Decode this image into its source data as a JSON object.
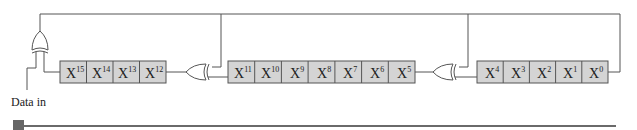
{
  "diagram": {
    "input_label": "Data in",
    "register_groups": [
      {
        "cells": [
          {
            "base": "X",
            "exp": "15"
          },
          {
            "base": "X",
            "exp": "14"
          },
          {
            "base": "X",
            "exp": "13"
          },
          {
            "base": "X",
            "exp": "12"
          }
        ]
      },
      {
        "cells": [
          {
            "base": "X",
            "exp": "11"
          },
          {
            "base": "X",
            "exp": "10"
          },
          {
            "base": "X",
            "exp": "9"
          },
          {
            "base": "X",
            "exp": "8"
          },
          {
            "base": "X",
            "exp": "7"
          },
          {
            "base": "X",
            "exp": "6"
          },
          {
            "base": "X",
            "exp": "5"
          }
        ]
      },
      {
        "cells": [
          {
            "base": "X",
            "exp": "4"
          },
          {
            "base": "X",
            "exp": "3"
          },
          {
            "base": "X",
            "exp": "2"
          },
          {
            "base": "X",
            "exp": "1"
          },
          {
            "base": "X",
            "exp": "0"
          }
        ]
      }
    ],
    "gates": [
      "xor-input",
      "xor-after-x12",
      "xor-after-x5"
    ],
    "colors": {
      "cell_fill": "#d4d4d4",
      "line": "#555555",
      "bar": "#6a6a6a"
    }
  }
}
